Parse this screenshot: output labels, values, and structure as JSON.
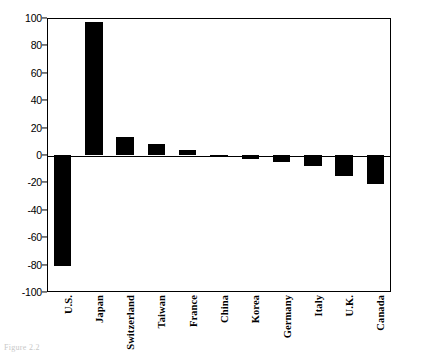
{
  "chart_data": {
    "type": "bar",
    "title": "",
    "subtitle": "",
    "xlabel": "",
    "ylabel": "",
    "categories": [
      "U.S.",
      "Japan",
      "Switzerland",
      "Taiwan",
      "France",
      "China",
      "Korea",
      "Germany",
      "Italy",
      "U.K.",
      "Canada"
    ],
    "values": [
      -81,
      97,
      13,
      8,
      4,
      -1,
      -3,
      -5,
      -8,
      -15,
      -21
    ],
    "ylim": [
      -100,
      100
    ],
    "yticks": [
      100,
      80,
      60,
      40,
      20,
      0,
      -20,
      -40,
      -60,
      -80,
      -100
    ],
    "ytick_labels": [
      "100",
      "80",
      "60",
      "40",
      "20",
      "0",
      "-20",
      "-40",
      "-60",
      "-80",
      "-100"
    ],
    "grid": false,
    "legend": null,
    "bar_color": "#000000",
    "frame": true,
    "xtick_rotation": 90
  },
  "caption": {
    "text": "Figure 2.2"
  },
  "colors": {
    "bar": "#000000",
    "axis": "#000000",
    "background": "#ffffff",
    "caption": "#c8c8c8"
  }
}
